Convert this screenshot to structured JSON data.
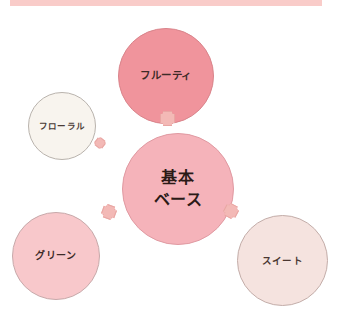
{
  "diagram": {
    "title_bar_color": "#f9ccc9",
    "center": {
      "label": "基本\nベース",
      "color": "#f5b3ba"
    },
    "nodes": [
      {
        "id": "fruity",
        "label": "フルーティ",
        "color": "#f0949c",
        "border": "#d9848b"
      },
      {
        "id": "floral",
        "label": "フローラル",
        "color": "#f8f4ee",
        "border": "#b9b3ad"
      },
      {
        "id": "green",
        "label": "グリーン",
        "color": "#f8c8cb",
        "border": "#c7a9aa"
      },
      {
        "id": "sweet",
        "label": "スイート",
        "color": "#f5e3df",
        "border": "#c3ada9"
      }
    ],
    "connectors": [
      {
        "id": "plus-top",
        "symbol": "+",
        "color": "#f3b9b6"
      },
      {
        "id": "plus-floral",
        "symbol": "+",
        "color": "#f3b9b6"
      },
      {
        "id": "plus-green",
        "symbol": "+",
        "color": "#f3b9b6"
      },
      {
        "id": "plus-sweet",
        "symbol": "+",
        "color": "#f3b9b6"
      }
    ]
  }
}
